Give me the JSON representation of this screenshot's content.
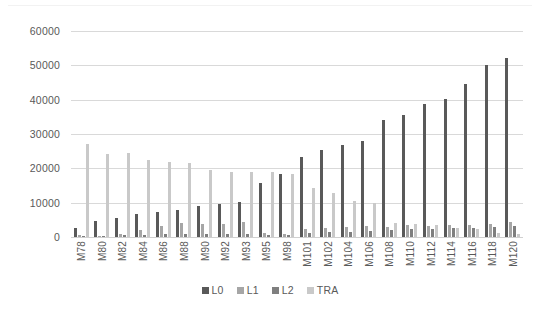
{
  "chart_data": {
    "type": "bar",
    "title": "",
    "subtitle": "",
    "xlabel": "",
    "ylabel": "",
    "ylim": [
      0,
      60000
    ],
    "ytick_step": 10000,
    "grid": true,
    "legend_position": "bottom",
    "categories": [
      "M78",
      "M80",
      "M82",
      "M84",
      "M86",
      "M88",
      "M90",
      "M92",
      "M93",
      "M95",
      "M98",
      "M101",
      "M102",
      "M104",
      "M106",
      "M108",
      "M110",
      "M112",
      "M114",
      "M116",
      "M118",
      "M120"
    ],
    "ytick_labels": [
      "60000",
      "50000",
      "40000",
      "30000",
      "20000",
      "10000",
      "0"
    ],
    "ytick_values": [
      60000,
      50000,
      40000,
      30000,
      20000,
      10000,
      0
    ],
    "series": [
      {
        "name": "L0",
        "color": "#595959",
        "values": [
          2600,
          4700,
          5400,
          6600,
          7200,
          8000,
          8900,
          9500,
          10300,
          15800,
          18300,
          23300,
          25400,
          26900,
          28100,
          34100,
          35400,
          38700,
          40100,
          44500,
          50000,
          52100
        ]
      },
      {
        "name": "L1",
        "color": "#a6a6a6",
        "values": [
          500,
          400,
          900,
          2100,
          3100,
          4100,
          3800,
          3800,
          4400,
          1100,
          900,
          2400,
          2500,
          3000,
          3300,
          3000,
          3400,
          3300,
          3400,
          3600,
          3900,
          4300
        ]
      },
      {
        "name": "L2",
        "color": "#7f7f7f",
        "values": [
          300,
          300,
          600,
          700,
          800,
          900,
          900,
          900,
          1000,
          700,
          600,
          1300,
          1400,
          1600,
          1800,
          2100,
          2200,
          2400,
          2500,
          2700,
          3000,
          3200
        ]
      },
      {
        "name": "TRA",
        "color": "#c9c9c9",
        "values": [
          27200,
          24100,
          24400,
          22300,
          21900,
          21600,
          19600,
          19000,
          18900,
          18800,
          18300,
          14200,
          12700,
          10600,
          9900,
          4000,
          3900,
          3600,
          2700,
          2300,
          1200,
          900
        ]
      }
    ]
  },
  "legend": {
    "items": [
      {
        "label": "L0",
        "color": "#595959"
      },
      {
        "label": "L1",
        "color": "#a6a6a6"
      },
      {
        "label": "L2",
        "color": "#7f7f7f"
      },
      {
        "label": "TRA",
        "color": "#c9c9c9"
      }
    ]
  },
  "colors": {
    "background": "#ffffff",
    "gridline": "#d9d9d9",
    "axis_text": "#595959",
    "frame": "#f2f2f2"
  }
}
